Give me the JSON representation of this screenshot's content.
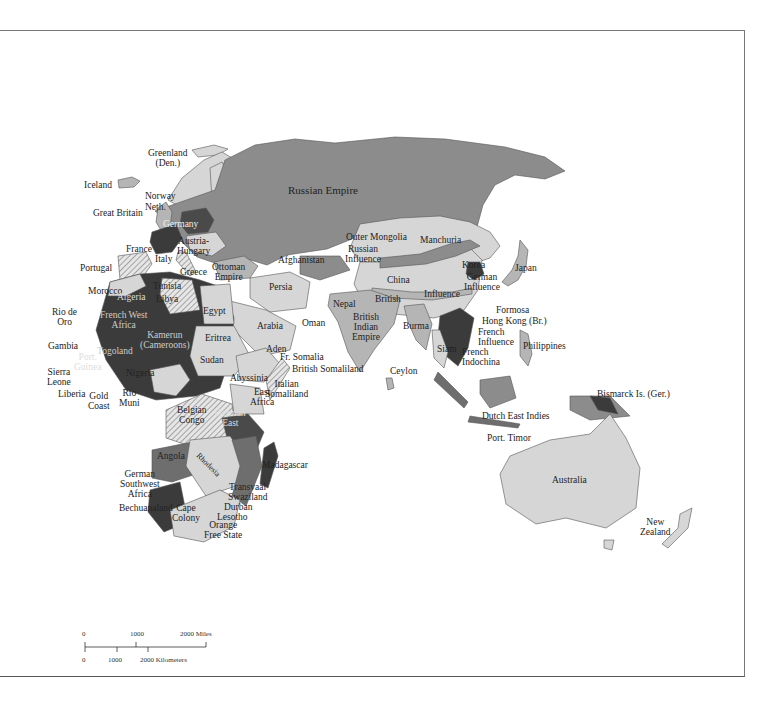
{
  "map": {
    "title": "",
    "colors": {
      "russian": "#8c8c8c",
      "british": "#b5b5b5",
      "french": "#3b3b3b",
      "german": "#4a4a4a",
      "light": "#d6d6d6",
      "portuguese": "#6e6e6e",
      "water": "#ffffff",
      "border": "#555555"
    },
    "labels": {
      "greenland": "Greenland",
      "greenland_den": "(Den.)",
      "iceland": "Iceland",
      "norway": "Norway",
      "sweden": "Sweden",
      "finland": "Finland",
      "neth": "Neth.",
      "den": "Den.",
      "great_britain": "Great Britain",
      "germany": "Germany",
      "bel": "Bel.",
      "france": "France",
      "austria_hungary_1": "Austria-",
      "austria_hungary_2": "Hungary",
      "portugal": "Portugal",
      "spain": "Spain",
      "italy": "Italy",
      "greece": "Greece",
      "ottoman_1": "Ottoman",
      "ottoman_2": "Empire",
      "russian_empire": "Russian Empire",
      "afghanistan": "Afghanistan",
      "outer_mongolia": "Outer Mongolia",
      "manchuria": "Manchuria",
      "russian_influence_1": "Russian",
      "russian_influence_2": "Influence",
      "korea": "Korea",
      "japan": "Japan",
      "german_influence_1": "German",
      "german_influence_2": "Influence",
      "china": "China",
      "british_china": "British",
      "influence_china": "Influence",
      "persia": "Persia",
      "nepal": "Nepal",
      "morocco": "Morocco",
      "algeria": "Algeria",
      "tunisia": "Tunisia",
      "libya": "Libya",
      "egypt": "Egypt",
      "arabia": "Arabia",
      "oman": "Oman",
      "british_indian_1": "British",
      "british_indian_2": "Indian",
      "british_indian_3": "Empire",
      "burma": "Burma",
      "formosa": "Formosa",
      "hong_kong": "Hong Kong (Br.)",
      "french_influence_1": "French",
      "french_influence_2": "Influence",
      "philippines": "Philippines",
      "siam": "Siam",
      "french_indochina_1": "French",
      "french_indochina_2": "Indochina",
      "rio_de_oro_1": "Rio de",
      "rio_de_oro_2": "Oro",
      "french_west_africa_1": "French West",
      "french_west_africa_2": "Africa",
      "kamerun_1": "Kamerun",
      "kamerun_2": "(Cameroons)",
      "togoland": "Togoland",
      "gambia": "Gambia",
      "port_guinea_1": "Port.",
      "port_guinea_2": "Guinea",
      "sierra_leone_1": "Sierra",
      "sierra_leone_2": "Leone",
      "liberia": "Liberia",
      "gold_coast_1": "Gold",
      "gold_coast_2": "Coast",
      "nigeria": "Nigeria",
      "rio_muni_1": "Rio",
      "rio_muni_2": "Muni",
      "french_equatorial": "French Eq. Africa",
      "eritrea": "Eritrea",
      "sudan": "Sudan",
      "aden": "Aden",
      "fr_somalia": "Fr. Somalia",
      "british_somaliland": "British Somaliland",
      "abyssinia": "Abyssinia",
      "italian_somaliland_1": "Italian",
      "italian_somaliland_2": "Somaliland",
      "ceylon": "Ceylon",
      "east_africa_1": "East",
      "east_africa_2": "Africa",
      "belgian_congo_1": "Belgian",
      "belgian_congo_2": "Congo",
      "german_east_1": "German",
      "german_east_2": "East",
      "angola": "Angola",
      "rhodesia": "Rhodesia",
      "mozambique": "Mozambique",
      "madagascar": "Madagascar",
      "german_sw_1": "German",
      "german_sw_2": "Southwest",
      "german_sw_3": "Africa",
      "transvaal": "Transvaal",
      "swaziland": "Swaziland",
      "durban": "Durban",
      "lesotho": "Lesotho",
      "bechuanaland": "Bechuanaland",
      "cape_1": "Cape",
      "cape_2": "Colony",
      "orange_1": "Orange",
      "orange_2": "Free State",
      "dutch_east_indies": "Dutch East Indies",
      "port_timor": "Port. Timor",
      "bismarck": "Bismarck Is. (Ger.)",
      "australia": "Australia",
      "new_zealand_1": "New",
      "new_zealand_2": "Zealand"
    },
    "scale": {
      "miles_0": "0",
      "miles_1000": "1000",
      "miles_2000": "2000 Miles",
      "km_0": "0",
      "km_1000": "1000",
      "km_2000": "2000 Kilometers"
    }
  }
}
